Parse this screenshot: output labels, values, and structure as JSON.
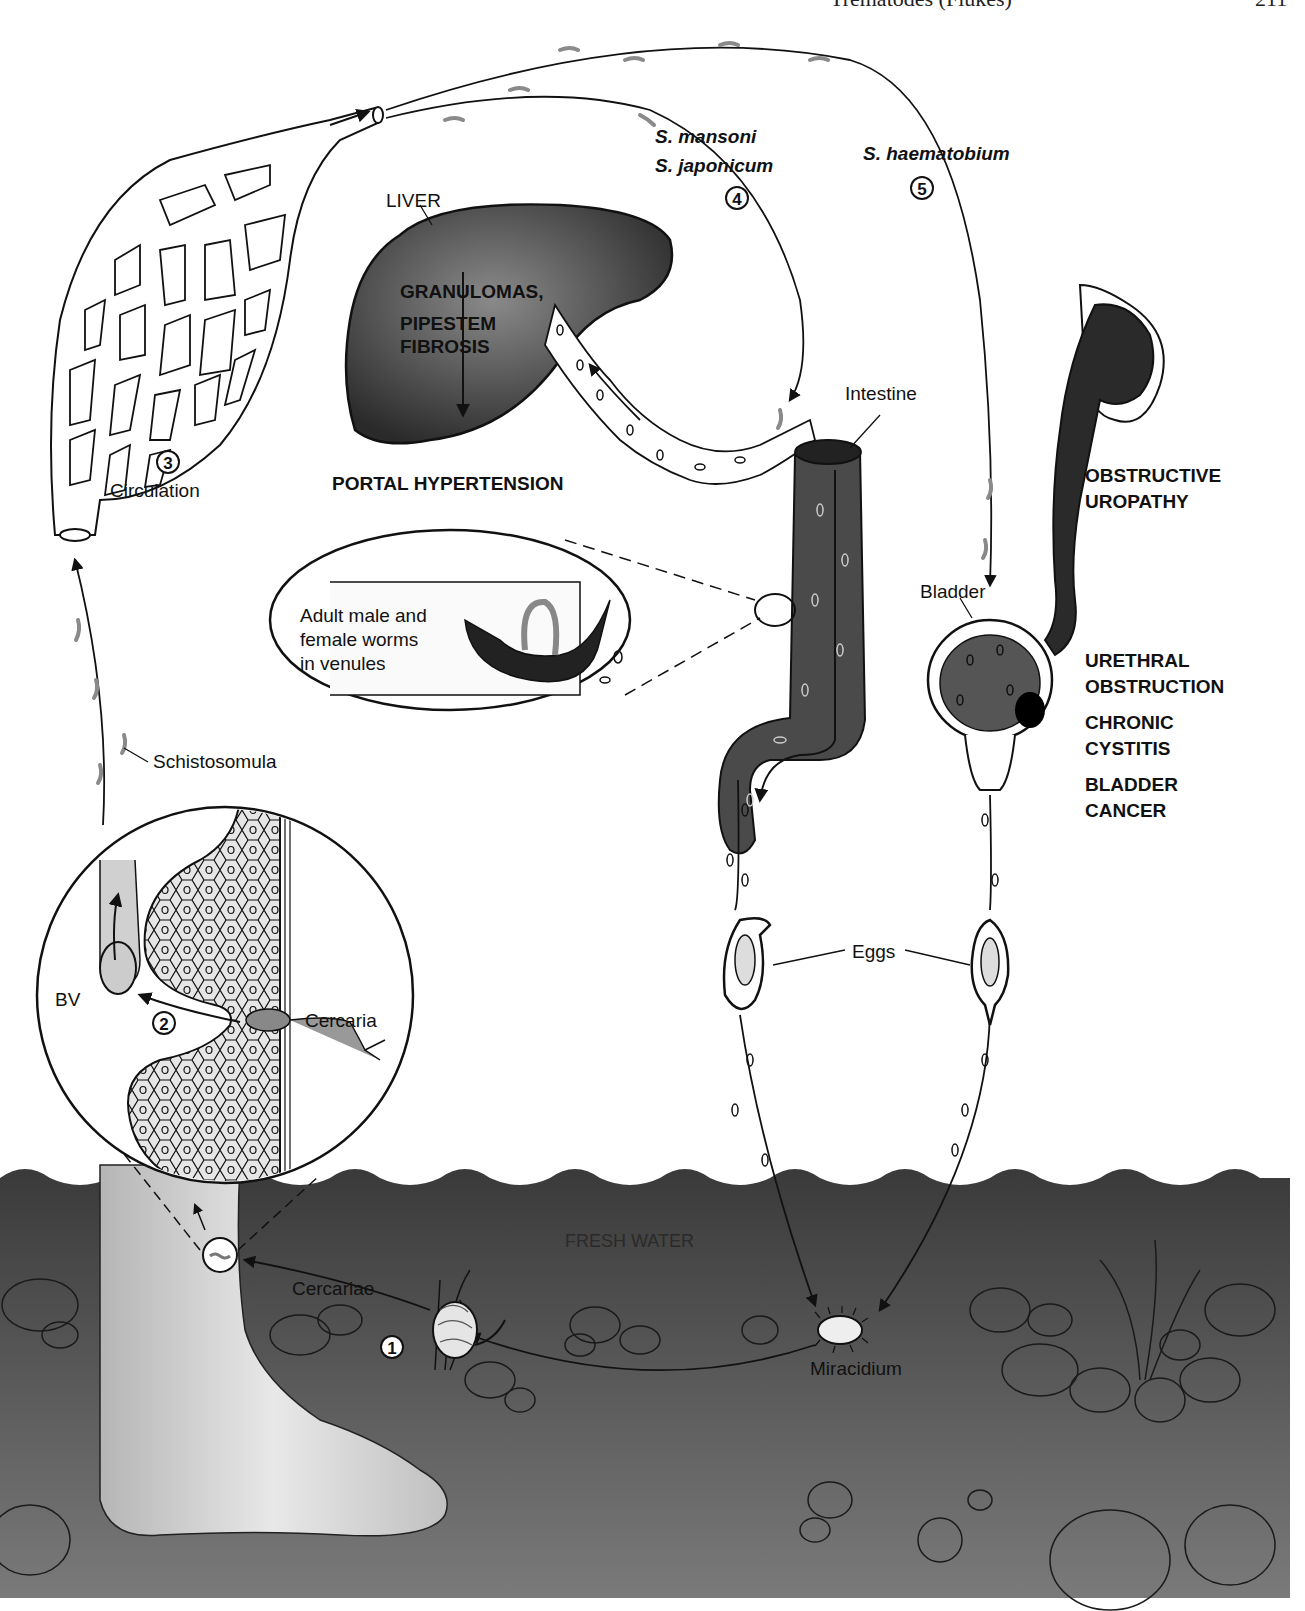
{
  "page_header": {
    "running_title": "Trematodes (Flukes)",
    "page_number": "211"
  },
  "species": {
    "group_intestinal_1": "S. mansoni",
    "group_intestinal_2": "S. japonicum",
    "group_urinary": "S. haematobium"
  },
  "stages": [
    {
      "number": "1",
      "label": "Cercariae"
    },
    {
      "number": "2",
      "label": "Cercaria"
    },
    {
      "number": "3",
      "label": "Circulation"
    },
    {
      "number": "4",
      "label": ""
    },
    {
      "number": "5",
      "label": ""
    }
  ],
  "labels": {
    "liver": "LIVER",
    "liver_path_1": "GRANULOMAS,",
    "liver_path_2": "PIPESTEM",
    "liver_path_3": "FIBROSIS",
    "portal": "PORTAL HYPERTENSION",
    "intestine": "Intestine",
    "worms_1": "Adult male and",
    "worms_2": "female worms",
    "worms_3": "in venules",
    "schistosomula": "Schistosomula",
    "bv": "BV",
    "cercaria": "Cercaria",
    "cercariae": "Cercariae",
    "bladder": "Bladder",
    "eggs": "Eggs",
    "fresh_water": "FRESH WATER",
    "miracidium": "Miracidium"
  },
  "urinary_pathology": [
    {
      "line1": "OBSTRUCTIVE",
      "line2": "UROPATHY"
    },
    {
      "line1": "URETHRAL",
      "line2": "OBSTRUCTION"
    },
    {
      "line1": "CHRONIC",
      "line2": "CYSTITIS"
    },
    {
      "line1": "BLADDER",
      "line2": "CANCER"
    }
  ],
  "colors": {
    "ink": "#111111",
    "organ_fill": "#3a3a3a",
    "water": "#4a4a4a",
    "skin": "#d9d9d9",
    "worm_gray": "#8a8a8a"
  }
}
